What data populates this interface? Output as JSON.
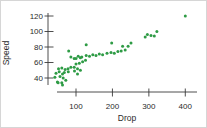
{
  "chart_data": {
    "type": "scatter",
    "title": "",
    "xlabel": "Drop",
    "ylabel": "Speed",
    "x_ticks": [
      100,
      200,
      300,
      400
    ],
    "y_ticks": [
      40,
      60,
      80,
      100,
      120
    ],
    "xlim": [
      25,
      430
    ],
    "ylim": [
      28,
      126
    ],
    "grid": false,
    "legend": "none",
    "marker_color": "#2E9B45",
    "axis_color": "#3a3a3a",
    "points": [
      [
        42,
        41
      ],
      [
        49,
        35
      ],
      [
        51,
        34
      ],
      [
        56,
        42
      ],
      [
        61,
        34
      ],
      [
        63,
        31
      ],
      [
        65,
        40
      ],
      [
        72,
        37
      ],
      [
        45,
        46
      ],
      [
        54,
        48
      ],
      [
        63,
        45
      ],
      [
        52,
        52
      ],
      [
        61,
        53
      ],
      [
        70,
        51
      ],
      [
        78,
        52
      ],
      [
        86,
        54
      ],
      [
        95,
        54
      ],
      [
        104,
        52
      ],
      [
        68,
        47
      ],
      [
        79,
        48
      ],
      [
        96,
        49
      ],
      [
        104,
        45
      ],
      [
        112,
        50
      ],
      [
        100,
        58
      ],
      [
        109,
        59
      ],
      [
        118,
        61
      ],
      [
        126,
        63
      ],
      [
        100,
        65
      ],
      [
        112,
        66
      ],
      [
        86,
        67
      ],
      [
        95,
        65
      ],
      [
        106,
        68
      ],
      [
        116,
        67
      ],
      [
        128,
        69
      ],
      [
        137,
        68
      ],
      [
        146,
        70
      ],
      [
        155,
        69
      ],
      [
        164,
        71
      ],
      [
        173,
        70
      ],
      [
        185,
        72
      ],
      [
        196,
        73
      ],
      [
        205,
        72
      ],
      [
        215,
        74
      ],
      [
        224,
        75
      ],
      [
        235,
        76
      ],
      [
        80,
        75
      ],
      [
        128,
        83
      ],
      [
        198,
        85
      ],
      [
        228,
        81
      ],
      [
        243,
        81
      ],
      [
        251,
        85
      ],
      [
        290,
        93
      ],
      [
        296,
        96
      ],
      [
        306,
        95
      ],
      [
        315,
        94
      ],
      [
        322,
        100
      ],
      [
        400,
        120
      ]
    ]
  }
}
